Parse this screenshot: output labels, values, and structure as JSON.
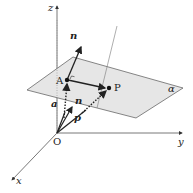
{
  "diagram": {
    "axes": {
      "x_label": "x",
      "y_label": "y",
      "z_label": "z",
      "origin_label": "O"
    },
    "plane": {
      "label": "α",
      "fill": "#e8e8e8",
      "stroke": "#555555"
    },
    "points": {
      "A": "A",
      "P": "P"
    },
    "vectors": {
      "normal_at_A": "n",
      "normal_at_O": "n",
      "position_a": "a",
      "position_p": "p"
    },
    "colors": {
      "line": "#222222",
      "axis": "#444444"
    }
  }
}
